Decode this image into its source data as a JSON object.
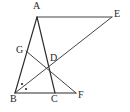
{
  "figure": {
    "type": "geometry-diagram",
    "width": 130,
    "height": 112,
    "background_color": "#ffffff",
    "stroke_color": "#2b2b2b"
  },
  "points": {
    "A": {
      "label": "A",
      "x": 37,
      "y": 17,
      "label_x": 33,
      "label_y": 1
    },
    "B": {
      "label": "B",
      "x": 15,
      "y": 93,
      "label_x": 10,
      "label_y": 94
    },
    "C": {
      "label": "C",
      "x": 55,
      "y": 93,
      "label_x": 51,
      "label_y": 94
    },
    "D": {
      "label": "D",
      "x": 49,
      "y": 66,
      "label_x": 50,
      "label_y": 53
    },
    "E": {
      "label": "E",
      "x": 112,
      "y": 17,
      "label_x": 114,
      "label_y": 9
    },
    "F": {
      "label": "F",
      "x": 76,
      "y": 93,
      "label_x": 78,
      "label_y": 90
    },
    "G": {
      "label": "G",
      "x": 26,
      "y": 51,
      "label_x": 16,
      "label_y": 45
    }
  },
  "segments": [
    {
      "name": "segment-AB",
      "from": "A",
      "to": "B",
      "weight": "normal"
    },
    {
      "name": "segment-AC",
      "from": "A",
      "to": "C",
      "weight": "normal"
    },
    {
      "name": "segment-BF",
      "from": "B",
      "to": "F",
      "weight": "normal"
    },
    {
      "name": "segment-AE",
      "from": "A",
      "to": "E",
      "weight": "thin"
    },
    {
      "name": "segment-EB",
      "from": "E",
      "to": "B",
      "weight": "thin"
    },
    {
      "name": "segment-GF",
      "from": "G",
      "to": "F",
      "weight": "thin"
    }
  ],
  "angle_marks": [
    {
      "name": "angle-mark-abd",
      "x": 22,
      "y": 84,
      "r": 1.1
    },
    {
      "name": "angle-mark-dbc",
      "x": 26,
      "y": 89,
      "r": 1.1
    }
  ]
}
